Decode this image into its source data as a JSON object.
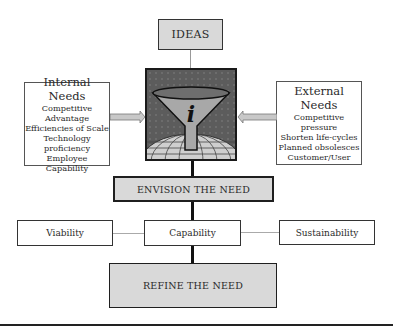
{
  "diagram": {
    "ideas": {
      "label": "IDEAS"
    },
    "internal_needs": {
      "title": "Internal Needs",
      "items": [
        "Competitive Advantage",
        "Efficiencies of Scale",
        "Technology proficiency",
        "Employee Capability"
      ]
    },
    "external_needs": {
      "title": "External Needs",
      "items": [
        "Competitive pressure",
        "Shorten life-cycles",
        "Planned obsolesces",
        "Customer/User"
      ]
    },
    "center_icon": {
      "name": "funnel-info-globe",
      "glyph": "i"
    },
    "envision": {
      "label": "ENVISION THE NEED"
    },
    "criteria": [
      {
        "label": "Viability"
      },
      {
        "label": "Capability"
      },
      {
        "label": "Sustainability"
      }
    ],
    "refine": {
      "label": "REFINE THE NEED"
    },
    "colors": {
      "box_fill": "#d9d9d9",
      "border": "#1f1f1f",
      "arrow_fill": "#c8c8c8"
    }
  }
}
